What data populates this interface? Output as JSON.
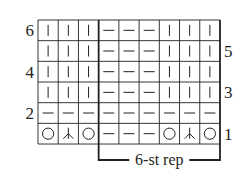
{
  "chart": {
    "columns": 9,
    "rows": 6,
    "grid": {
      "left": 38,
      "top": 20,
      "cell_w": 20.22,
      "cell_h": 20.67
    },
    "colors": {
      "line": "#231f20",
      "background": "#ffffff"
    },
    "row_numbers": {
      "left": [
        {
          "row": 6,
          "label": "6"
        },
        {
          "row": 4,
          "label": "4"
        },
        {
          "row": 2,
          "label": "2"
        }
      ],
      "right": [
        {
          "row": 5,
          "label": "5"
        },
        {
          "row": 3,
          "label": "3"
        },
        {
          "row": 1,
          "label": "1"
        }
      ]
    },
    "repeat": {
      "label": "6-st rep",
      "from_col": 3,
      "to_col": 9
    },
    "legend_symbols": {
      "|": "knit-icon",
      "-": "purl-icon",
      "O": "yarn-over-icon",
      "Y": "double-decrease-icon"
    },
    "cells_top_to_bottom": [
      [
        "|",
        "|",
        "|",
        "-",
        "-",
        "-",
        "|",
        "|",
        "|"
      ],
      [
        "|",
        "|",
        "|",
        "-",
        "-",
        "-",
        "|",
        "|",
        "|"
      ],
      [
        "|",
        "|",
        "|",
        "-",
        "-",
        "-",
        "|",
        "|",
        "|"
      ],
      [
        "|",
        "|",
        "|",
        "-",
        "-",
        "-",
        "|",
        "|",
        "|"
      ],
      [
        "-",
        "-",
        "-",
        "-",
        "-",
        "-",
        "-",
        "-",
        "-"
      ],
      [
        "O",
        "Y",
        "O",
        "-",
        "-",
        "-",
        "O",
        "Y",
        "O"
      ]
    ]
  }
}
